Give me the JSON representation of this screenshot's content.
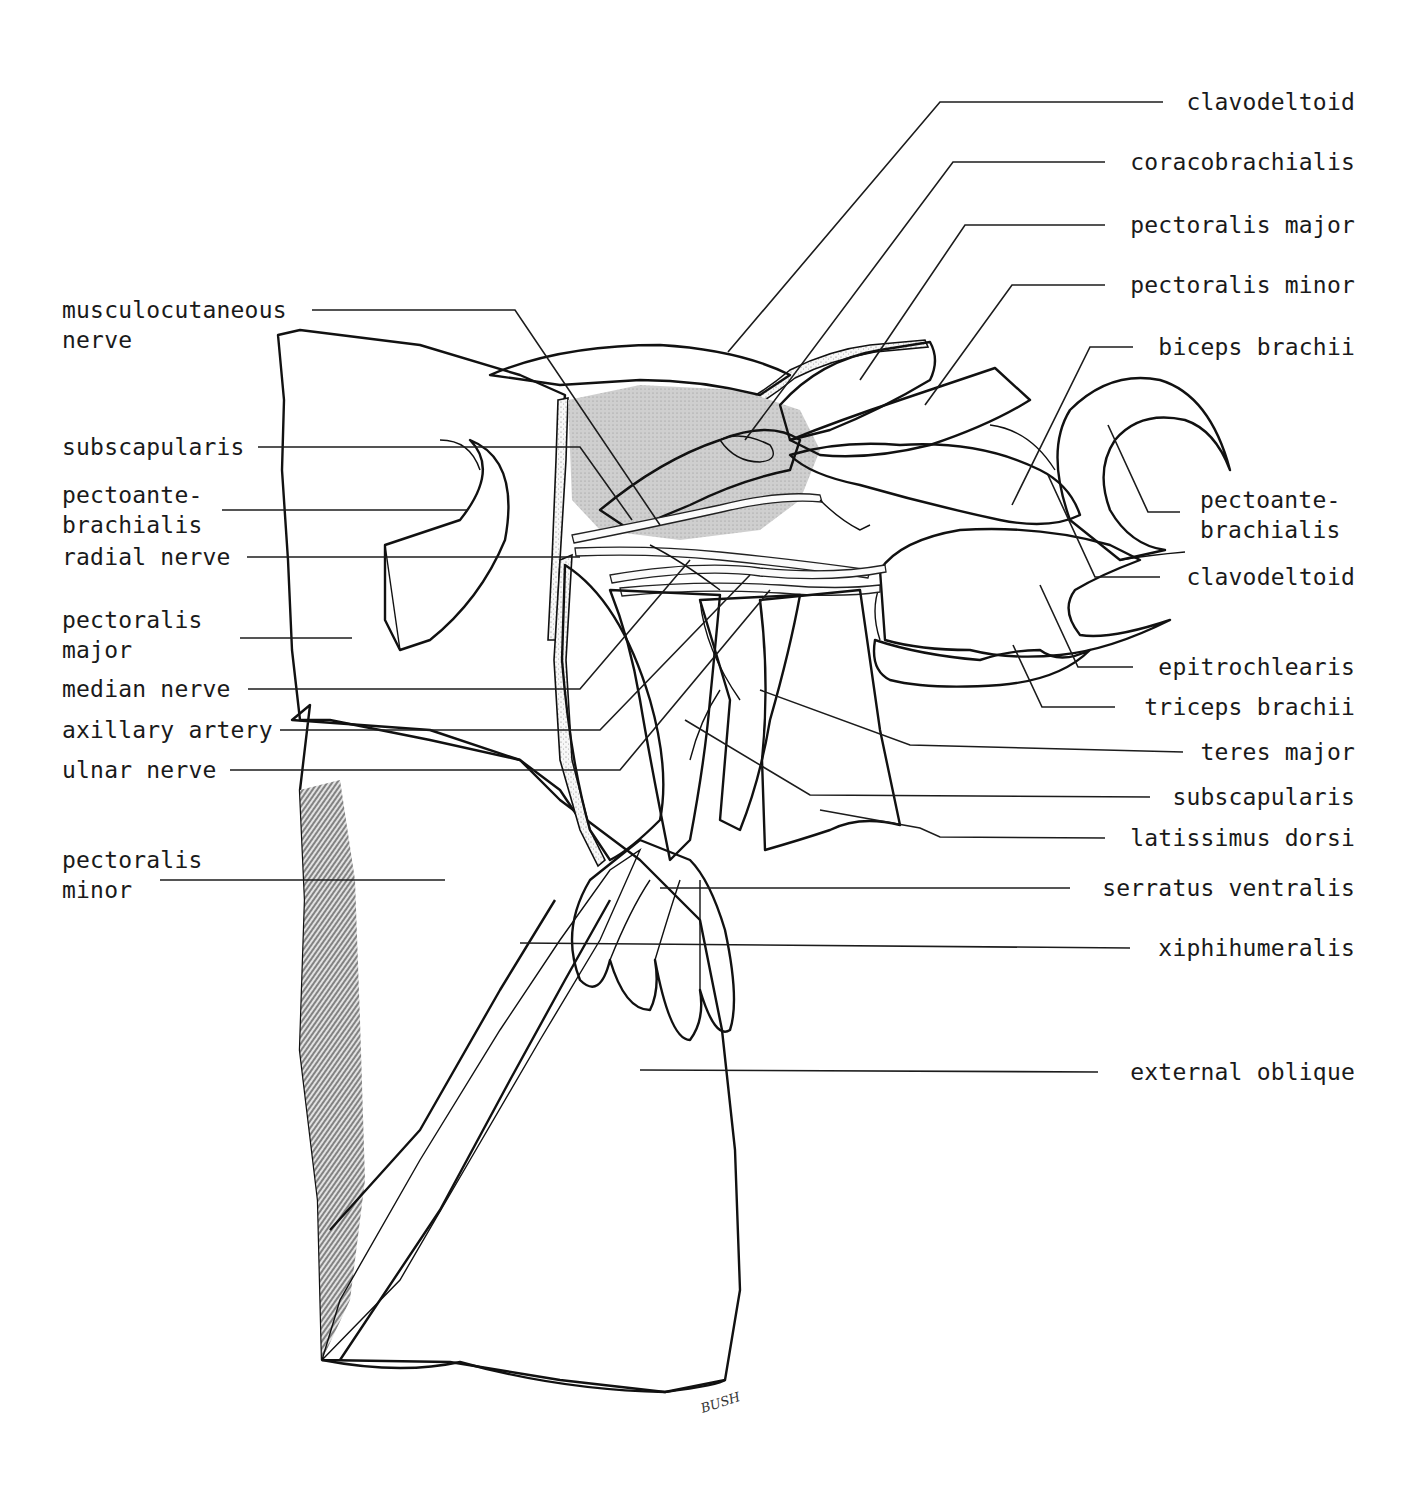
{
  "figure": {
    "type": "anatomical illustration",
    "signature": "BUSH"
  },
  "labels_left": [
    {
      "id": "musculocutaneous-nerve",
      "text": "musculocutaneous\nnerve"
    },
    {
      "id": "subscapularis-left",
      "text": "subscapularis"
    },
    {
      "id": "pectoantebrachialis-left",
      "text": "pectoante-\nbrachialis"
    },
    {
      "id": "radial-nerve",
      "text": "radial nerve"
    },
    {
      "id": "pectoralis-major-left",
      "text": "pectoralis\nmajor"
    },
    {
      "id": "median-nerve",
      "text": "median nerve"
    },
    {
      "id": "axillary-artery",
      "text": "axillary artery"
    },
    {
      "id": "ulnar-nerve",
      "text": "ulnar nerve"
    },
    {
      "id": "pectoralis-minor-left",
      "text": "pectoralis\nminor"
    }
  ],
  "labels_right": [
    {
      "id": "clavodeltoid-top",
      "text": "clavodeltoid"
    },
    {
      "id": "coracobrachialis",
      "text": "coracobrachialis"
    },
    {
      "id": "pectoralis-major-right",
      "text": "pectoralis major"
    },
    {
      "id": "pectoralis-minor-right",
      "text": "pectoralis minor"
    },
    {
      "id": "biceps-brachii",
      "text": "biceps brachii"
    },
    {
      "id": "pectoantebrachialis-right",
      "text": "pectoante-\nbrachialis"
    },
    {
      "id": "clavodeltoid-mid",
      "text": "clavodeltoid"
    },
    {
      "id": "epitrochlearis",
      "text": "epitrochlearis"
    },
    {
      "id": "triceps-brachii",
      "text": "triceps brachii"
    },
    {
      "id": "teres-major",
      "text": "teres major"
    },
    {
      "id": "subscapularis-right",
      "text": "subscapularis"
    },
    {
      "id": "latissimus-dorsi",
      "text": "latissimus dorsi"
    },
    {
      "id": "serratus-ventralis",
      "text": "serratus ventralis"
    },
    {
      "id": "xiphihumeralis",
      "text": "xiphihumeralis"
    },
    {
      "id": "external-oblique",
      "text": "external oblique"
    }
  ],
  "colors": {
    "ink": "#111111",
    "paper": "#ffffff",
    "shade": "#8a8a8a"
  }
}
